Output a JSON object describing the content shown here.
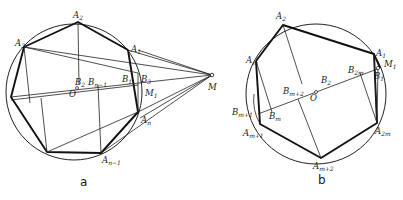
{
  "figure_a": {
    "caption": "a",
    "labels": {
      "A1": "A",
      "A1_sub": "1",
      "A2": "A",
      "A2_sub": "2",
      "A3": "A",
      "A3_sub": "3",
      "An": "A",
      "An_sub": "n",
      "An1": "A",
      "An1_sub": "n−1",
      "B1": "B",
      "B1_sub": "1",
      "B2": "B",
      "B2_sub": "2",
      "B3": "B",
      "B3_sub": "3",
      "Bn1": "B",
      "Bn1_sub": "n−1",
      "M1": "M",
      "M1_sub": "1",
      "M": "M",
      "O": "O"
    }
  },
  "figure_b": {
    "caption": "b",
    "labels": {
      "A1": "A",
      "A1_sub": "1",
      "A2": "A",
      "A2_sub": "2",
      "Am": "A",
      "Am_sub": "m",
      "Am1": "A",
      "Am1_sub": "m+1",
      "Am2": "A",
      "Am2_sub": "m+2",
      "A2m": "A",
      "A2m_sub": "2m",
      "B1": "B",
      "B1_sub": "1",
      "B2": "B",
      "B2_sub": "2",
      "B2m": "B",
      "B2m_sub": "2m",
      "Bm": "B",
      "Bm_sub": "m",
      "Bm1": "B",
      "Bm1_sub": "m+1",
      "Bm2": "B",
      "Bm2_sub": "m+2",
      "M1": "M",
      "M1_sub": "1",
      "O": "O"
    }
  }
}
